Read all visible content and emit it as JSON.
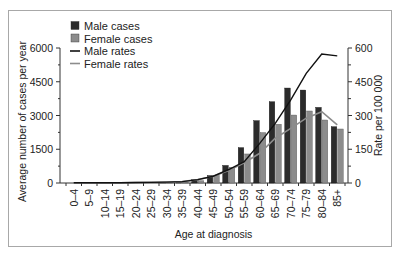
{
  "chart_data": {
    "type": "bar",
    "title": "",
    "xlabel": "Age at diagnosis",
    "ylabel": "Average number of cases per year",
    "y2label": "Rate per 100 000",
    "ylim": [
      0,
      6000
    ],
    "y2lim": [
      0,
      600
    ],
    "yticks": [
      0,
      1500,
      3000,
      4500,
      6000
    ],
    "y2ticks": [
      0,
      150,
      300,
      450,
      600
    ],
    "grid": false,
    "legend_position": "upper-left",
    "categories": [
      "0–4",
      "5–9",
      "10–14",
      "15–19",
      "20–24",
      "25–29",
      "30–34",
      "35–39",
      "40–44",
      "45–49",
      "50–54",
      "55–59",
      "60–64",
      "65–69",
      "70–74",
      "75–79",
      "80–84",
      "85+"
    ],
    "series": [
      {
        "name": "Male cases",
        "type": "bar",
        "axis": "left",
        "color": "#2b2b2b",
        "values": [
          0,
          0,
          0,
          0,
          0,
          0,
          10,
          30,
          150,
          330,
          780,
          1570,
          2770,
          3610,
          4220,
          4130,
          3360,
          2500
        ]
      },
      {
        "name": "Female cases",
        "type": "bar",
        "axis": "left",
        "color": "#8c8c8c",
        "values": [
          0,
          0,
          0,
          0,
          0,
          0,
          10,
          30,
          100,
          340,
          700,
          1290,
          2240,
          2610,
          3020,
          3200,
          2800,
          2400
        ]
      },
      {
        "name": "Male rates",
        "type": "line",
        "axis": "right",
        "color": "#111111",
        "values": [
          1,
          1,
          1,
          1,
          2,
          3,
          4,
          6,
          15,
          30,
          60,
          95,
          176,
          265,
          369,
          487,
          573,
          565
        ]
      },
      {
        "name": "Female rates",
        "type": "line",
        "axis": "right",
        "color": "#8c8c8c",
        "values": [
          1,
          1,
          1,
          1,
          2,
          3,
          4,
          6,
          15,
          30,
          55,
          90,
          132,
          199,
          243,
          288,
          317,
          258
        ]
      }
    ]
  },
  "legend": {
    "items": [
      {
        "label": "Male cases",
        "kind": "box",
        "color": "#2b2b2b"
      },
      {
        "label": "Female cases",
        "kind": "box",
        "color": "#8c8c8c"
      },
      {
        "label": "Male rates",
        "kind": "line",
        "color": "#111111"
      },
      {
        "label": "Female rates",
        "kind": "line",
        "color": "#8c8c8c"
      }
    ]
  },
  "axes": {
    "left_title": "Average number of cases per year",
    "right_title": "Rate per 100 000",
    "x_title": "Age at diagnosis"
  }
}
